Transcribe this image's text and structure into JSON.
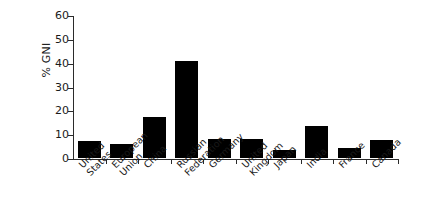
{
  "chart_data": {
    "type": "bar",
    "title": "",
    "subtitle": "",
    "xlabel": "",
    "ylabel": "% GNI",
    "ylim": [
      0,
      60
    ],
    "yticks": [
      0,
      10,
      20,
      30,
      40,
      50,
      60
    ],
    "ytick_labels": [
      "0",
      "10",
      "20",
      "30",
      "40",
      "50",
      "60"
    ],
    "grid": false,
    "legend": false,
    "bar_color": "#000000",
    "axis_color": "#2b2b2b",
    "categories": [
      "United States",
      "European Union",
      "China",
      "Russian Federation",
      "Germany",
      "United Kingdom",
      "Japan",
      "India",
      "France",
      "Canada"
    ],
    "category_labels": [
      "United\nStates",
      "European\nUnion",
      "China",
      "Russian\nFederation",
      "Germany",
      "United\nKingdom",
      "Japan",
      "India",
      "France",
      "Canada"
    ],
    "values": [
      7.0,
      5.8,
      17.0,
      40.5,
      8.1,
      7.8,
      3.5,
      13.3,
      4.3,
      7.6
    ]
  }
}
